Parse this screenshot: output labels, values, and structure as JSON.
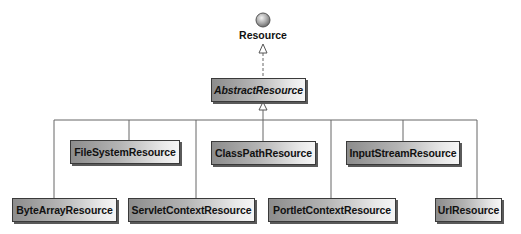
{
  "diagram": {
    "type": "uml-class-hierarchy",
    "interface": {
      "name": "Resource",
      "icon": "interface-lollipop-icon"
    },
    "abstract_class": {
      "name": "AbstractResource",
      "italic": true
    },
    "subclasses": [
      {
        "name": "FileSystemResource",
        "row": 1
      },
      {
        "name": "ClassPathResource",
        "row": 1
      },
      {
        "name": "InputStreamResource",
        "row": 1
      },
      {
        "name": "ByteArrayResource",
        "row": 2
      },
      {
        "name": "ServletContextResource",
        "row": 2
      },
      {
        "name": "PortletContextResource",
        "row": 2
      },
      {
        "name": "UrlResource",
        "row": 2
      }
    ],
    "relations": [
      {
        "from": "AbstractResource",
        "to": "Resource",
        "kind": "realization"
      },
      {
        "from": "FileSystemResource",
        "to": "AbstractResource",
        "kind": "generalization"
      },
      {
        "from": "ClassPathResource",
        "to": "AbstractResource",
        "kind": "generalization"
      },
      {
        "from": "InputStreamResource",
        "to": "AbstractResource",
        "kind": "generalization"
      },
      {
        "from": "ByteArrayResource",
        "to": "AbstractResource",
        "kind": "generalization"
      },
      {
        "from": "ServletContextResource",
        "to": "AbstractResource",
        "kind": "generalization"
      },
      {
        "from": "PortletContextResource",
        "to": "AbstractResource",
        "kind": "generalization"
      },
      {
        "from": "UrlResource",
        "to": "AbstractResource",
        "kind": "generalization"
      }
    ]
  },
  "colors": {
    "box_gradient_dark": "#8c8c8c",
    "box_gradient_light": "#f6f6f6",
    "border": "#3a3a3a",
    "line": "#666666"
  }
}
